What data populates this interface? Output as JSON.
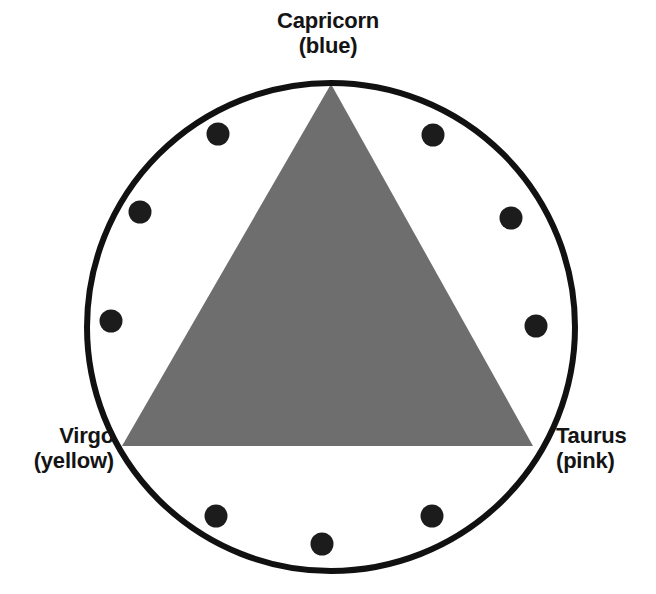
{
  "diagram": {
    "title_text": "Zodiac triangle diagram",
    "background_color": "#ffffff",
    "circle": {
      "name": "zodiac-wheel",
      "center_x": 331,
      "center_y": 327,
      "radius": 244,
      "stroke_color": "#111111",
      "stroke_width": 6,
      "fill": "none"
    },
    "triangle": {
      "name": "elemental-trine",
      "fill_color": "#6e6e6e",
      "vertices": [
        {
          "label": "Capricorn",
          "x": 331,
          "y": 84
        },
        {
          "label": "Virgo",
          "x": 122,
          "y": 446
        },
        {
          "label": "Taurus",
          "x": 533,
          "y": 446
        }
      ]
    },
    "dots": {
      "name": "zodiac-sign-markers",
      "color": "#1c1c1c",
      "radius": 11.5,
      "count": 9,
      "positions": [
        {
          "x": 218,
          "y": 134
        },
        {
          "x": 433,
          "y": 135
        },
        {
          "x": 140,
          "y": 212
        },
        {
          "x": 511,
          "y": 218
        },
        {
          "x": 111,
          "y": 321
        },
        {
          "x": 536,
          "y": 326
        },
        {
          "x": 216,
          "y": 516
        },
        {
          "x": 322,
          "y": 544
        },
        {
          "x": 432,
          "y": 516
        }
      ]
    }
  },
  "labels": {
    "capricorn": {
      "sign": "Capricorn",
      "color_note": "(blue)"
    },
    "virgo": {
      "sign": "Virgo",
      "color_note": "(yellow)"
    },
    "taurus": {
      "sign": "Taurus",
      "color_note": "(pink)"
    }
  }
}
